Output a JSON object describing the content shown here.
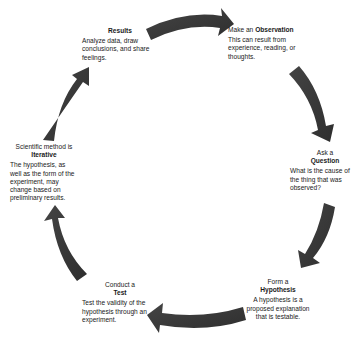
{
  "diagram": {
    "type": "cycle",
    "arrow_color": "#3a3a3a",
    "steps": [
      {
        "id": "observation",
        "prefix": "Make an",
        "title": "Observation",
        "description": "This can result from experience, reading, or thoughts."
      },
      {
        "id": "question",
        "prefix": "Ask a",
        "title": "Question",
        "description": "What is the cause of the thing that was observed?"
      },
      {
        "id": "hypothesis",
        "prefix": "Form a",
        "title": "Hypothesis",
        "description": "A hypothesis is a proposed explanation that is testable."
      },
      {
        "id": "test",
        "prefix": "Conduct a",
        "title": "Test",
        "description": "Test the validity of the hypothesis through an experiment."
      },
      {
        "id": "iterative",
        "prefix": "Scientific method is",
        "title": "Iterative",
        "description": "The hypothesis, as well as the form of the experiment, may change based on preliminary results."
      },
      {
        "id": "results",
        "prefix": "",
        "title": "Results",
        "description": "Analyze data, draw conclusions, and share feelings."
      }
    ]
  }
}
